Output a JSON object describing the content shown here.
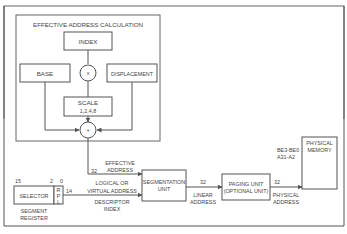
{
  "title": "EFFECTIVE ADDRESS CALCULATION",
  "boxes": {
    "index": "INDEX",
    "base": "BASE",
    "displacement": "DISPLACEMENT",
    "scale_line1": "SCALE",
    "scale_line2": "1,2,4,8",
    "selector": "SELECTOR",
    "rpl_r": "R",
    "rpl_p": "P",
    "rpl_l": "L",
    "segmentation_line1": "SEGMENTATION",
    "segmentation_line2": "UNIT",
    "paging_line1": "PAGING UNIT",
    "paging_line2": "(OPTIONAL UNIT)",
    "physical_memory_line1": "PHYSICAL",
    "physical_memory_line2": "MEMORY"
  },
  "operators": {
    "multiply": "x",
    "add": "+"
  },
  "labels": {
    "effective_address_line1": "EFFECTIVE",
    "effective_address_line2": "ADDRESS",
    "effective_width": "32",
    "logical_line1": "LOGICAL OR",
    "logical_line2": "VIRTUAL ADDRESS",
    "descriptor_line1": "DESCRIPTOR",
    "descriptor_line2": "INDEX",
    "selector_width": "14",
    "bit15": "15",
    "bit2": "2",
    "bit0": "0",
    "segment_register_line1": "SEGMENT",
    "segment_register_line2": "REGISTER",
    "linear_width": "32",
    "linear_line1": "LINEAR",
    "linear_line2": "ADDRESS",
    "physical_width": "32",
    "physical_line1": "PHYSICAL",
    "physical_line2": "ADDRESS",
    "bus_signals_line1": "BE3-BE0",
    "bus_signals_line2": "A31-A2"
  }
}
